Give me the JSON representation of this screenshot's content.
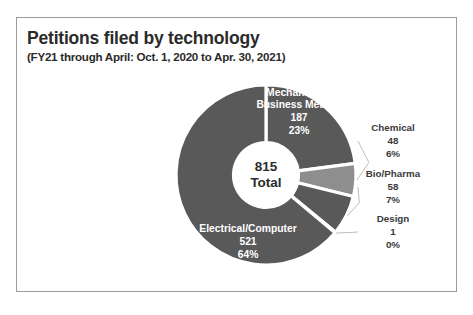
{
  "chart_data": {
    "type": "pie",
    "title": "Petitions filed by technology",
    "subtitle": "(FY21 through April: Oct. 1, 2020 to Apr. 30, 2021)",
    "center_value": "815",
    "center_caption": "Total",
    "total": 815,
    "xlabel": "",
    "ylabel": "",
    "legend_position": "none",
    "grid": false,
    "donut": true,
    "categories": [
      "Mechanical & Business Method",
      "Chemical",
      "Bio/Pharma",
      "Design",
      "Electrical/Computer"
    ],
    "values": [
      187,
      48,
      58,
      1,
      521
    ],
    "percents": [
      "23%",
      "6%",
      "7%",
      "0%",
      "64%"
    ],
    "colors": [
      "#595959",
      "#8e8e8e",
      "#595959",
      "#8e8e8e",
      "#595959"
    ],
    "slices": [
      {
        "name": "Mechanical & Business Method",
        "label_line1": "Mechanical &",
        "label_line2": "Business Method",
        "value": "187",
        "percent": "23%",
        "color": "#595959",
        "label_inside": true
      },
      {
        "name": "Chemical",
        "label_line1": "Chemical",
        "label_line2": "",
        "value": "48",
        "percent": "6%",
        "color": "#8e8e8e",
        "label_inside": false
      },
      {
        "name": "Bio/Pharma",
        "label_line1": "Bio/Pharma",
        "label_line2": "",
        "value": "58",
        "percent": "7%",
        "color": "#595959",
        "label_inside": false
      },
      {
        "name": "Design",
        "label_line1": "Design",
        "label_line2": "",
        "value": "1",
        "percent": "0%",
        "color": "#8e8e8e",
        "label_inside": false
      },
      {
        "name": "Electrical/Computer",
        "label_line1": "Electrical/Computer",
        "label_line2": "",
        "value": "521",
        "percent": "64%",
        "color": "#595959",
        "label_inside": true
      }
    ]
  }
}
